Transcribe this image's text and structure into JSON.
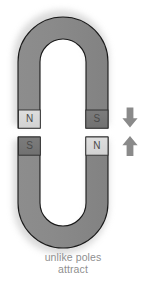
{
  "figure": {
    "title_caption_line1": "unlike poles",
    "title_caption_line2": "attract",
    "background_color": "#ffffff",
    "magnet_body_color": "#878787",
    "magnet_body_color_light": "#949494",
    "magnet_outline_color": "#1a1a1a",
    "pole_light_color": "#d9d9d9",
    "pole_dark_color": "#767676",
    "pole_outline_color": "#2b2b2b",
    "label_text_color": "#4a4a4a",
    "arrow_color": "#8a8a8a",
    "shadow_color": "#c9c9c9",
    "caption_text_color": "#8f8f8f"
  },
  "top_magnet": {
    "name": "horseshoe-magnet-top",
    "orientation": "opening-down",
    "left_pole": {
      "label": "N",
      "polarity": "north",
      "shade": "light"
    },
    "right_pole": {
      "label": "S",
      "polarity": "south",
      "shade": "dark"
    }
  },
  "bottom_magnet": {
    "name": "horseshoe-magnet-bottom",
    "orientation": "opening-up",
    "left_pole": {
      "label": "S",
      "polarity": "south",
      "shade": "dark"
    },
    "right_pole": {
      "label": "N",
      "polarity": "north",
      "shade": "light"
    }
  },
  "arrows": [
    {
      "name": "force-arrow-down",
      "direction": "down",
      "meaning": "attraction toward lower magnet"
    },
    {
      "name": "force-arrow-up",
      "direction": "up",
      "meaning": "attraction toward upper magnet"
    }
  ]
}
